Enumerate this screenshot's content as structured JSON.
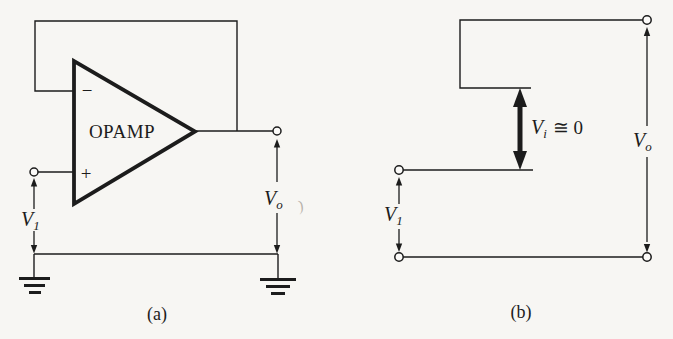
{
  "palette": {
    "paper": "#f7f6f3",
    "ink": "#1c1c1c",
    "artifact_gray": "#b7b2aa"
  },
  "circuit_a": {
    "caption": "(a)",
    "opamp_label": "OPAMP",
    "inverting_sign": "−",
    "noninverting_sign": "+",
    "v1_base": "V",
    "v1_sub": "1",
    "vo_base": "V",
    "vo_sub": "o",
    "artifact_mark": ")"
  },
  "circuit_b": {
    "caption": "(b)",
    "v1_base": "V",
    "v1_sub": "1",
    "vo_base": "V",
    "vo_sub": "o",
    "vi_base": "V",
    "vi_sub": "i",
    "vi_relation": "≅ 0"
  }
}
